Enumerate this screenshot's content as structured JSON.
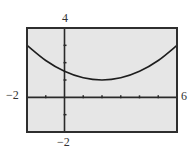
{
  "chart_data": {
    "type": "line",
    "title": "",
    "xlabel": "",
    "ylabel": "",
    "xlim": [
      -2,
      6
    ],
    "ylim": [
      -2,
      4
    ],
    "x_tick_step": 1,
    "y_tick_step": 1,
    "grid": false,
    "legend": null,
    "tick_labels": {
      "xmin": "−2",
      "xmax": "6",
      "ymin": "−2",
      "ymax": "4"
    },
    "series": [
      {
        "name": "curve",
        "description": "Parabola opening upward with vertex near (2, 1)",
        "x": [
          -2,
          -1,
          0,
          1,
          2,
          3,
          4,
          5,
          6
        ],
        "y": [
          3.0,
          2.125,
          1.5,
          1.125,
          1.0,
          1.125,
          1.5,
          2.125,
          3.0
        ]
      }
    ],
    "colors": {
      "plot_background": "#e6e6e6",
      "frame": "#2e2e2e",
      "axes": "#2a2a2a",
      "curve": "#1e1e1e"
    }
  }
}
